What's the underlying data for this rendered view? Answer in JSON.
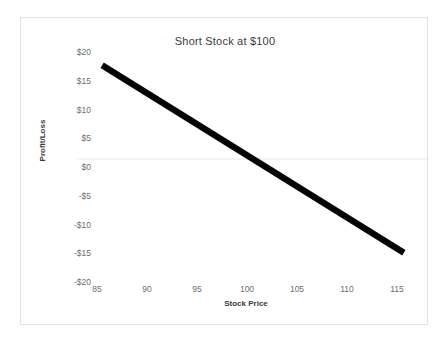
{
  "chart_data": {
    "type": "line",
    "title": "Short Stock at $100",
    "xlabel": "Stock Price",
    "ylabel": "Profit/Loss",
    "x": [
      85,
      115
    ],
    "values": [
      15,
      -15
    ],
    "series": [
      {
        "name": "Short Stock Payoff",
        "x": [
          85,
          115
        ],
        "values": [
          15,
          -15
        ],
        "color": "#050505"
      }
    ],
    "xlim": [
      82.5,
      117.5
    ],
    "ylim": [
      -20,
      20
    ],
    "xticks": [
      85,
      90,
      95,
      100,
      105,
      110,
      115
    ],
    "xtick_labels": [
      "85",
      "90",
      "95",
      "100",
      "105",
      "110",
      "115"
    ],
    "yticks": [
      20,
      15,
      10,
      5,
      0,
      -5,
      -10,
      -15,
      -20
    ],
    "ytick_labels": [
      "$20",
      "$15",
      "$10",
      "$5",
      "$0",
      "-$5",
      "-$10",
      "-$15",
      "-$20"
    ],
    "grid": "zero-line-only",
    "gridline_values": [
      0
    ],
    "legend": null,
    "legend_position": "none",
    "annotations": [],
    "breakeven": 100,
    "colors": {
      "line": "#050505",
      "gridline": "#e8e8e8",
      "border": "#e2e2e2",
      "tick_text": "#6e6e6e",
      "title_text": "#3b3b3b",
      "background": "#ffffff"
    }
  }
}
